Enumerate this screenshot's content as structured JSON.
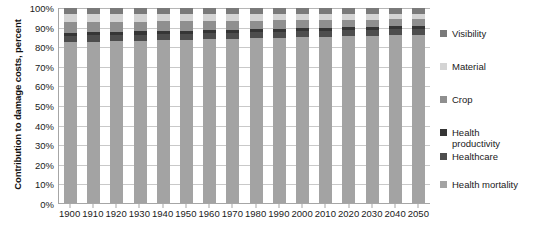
{
  "chart_data": {
    "type": "bar",
    "subtype": "100% stacked column",
    "title": "",
    "xlabel": "",
    "ylabel": "Contribution to damage costs, percent",
    "ylim": [
      0,
      100
    ],
    "yticks": [
      "0%",
      "10%",
      "20%",
      "30%",
      "40%",
      "50%",
      "60%",
      "70%",
      "80%",
      "90%",
      "100%"
    ],
    "ytick_values": [
      0,
      10,
      20,
      30,
      40,
      50,
      60,
      70,
      80,
      90,
      100
    ],
    "grid": true,
    "grid_axis": "y",
    "legend_position": "right",
    "categories": [
      "1900",
      "1910",
      "1920",
      "1930",
      "1940",
      "1950",
      "1960",
      "1970",
      "1980",
      "1990",
      "2000",
      "2010",
      "2020",
      "2030",
      "2040",
      "2050"
    ],
    "stack_order_bottom_to_top": [
      "Health mortality",
      "Healthcare",
      "Health productivity",
      "Crop",
      "Material",
      "Visibility"
    ],
    "series": [
      {
        "name": "Health mortality",
        "color": "#a3a3a3",
        "values": [
          82.5,
          82.8,
          83.0,
          83.2,
          83.4,
          83.6,
          83.9,
          84.1,
          84.4,
          84.6,
          84.9,
          85.1,
          85.4,
          85.6,
          85.9,
          86.1
        ]
      },
      {
        "name": "Healthcare",
        "color": "#4d4d4d",
        "values": [
          3.2,
          3.2,
          3.2,
          3.2,
          3.2,
          3.2,
          3.2,
          3.2,
          3.2,
          3.2,
          3.2,
          3.2,
          3.1,
          3.1,
          3.1,
          3.1
        ]
      },
      {
        "name": "Health productivity",
        "color": "#353535",
        "values": [
          1.6,
          1.6,
          1.6,
          1.6,
          1.6,
          1.6,
          1.6,
          1.6,
          1.6,
          1.6,
          1.6,
          1.6,
          1.6,
          1.6,
          1.6,
          1.6
        ]
      },
      {
        "name": "Crop",
        "color": "#8f8f8f",
        "values": [
          5.4,
          5.2,
          5.1,
          5.0,
          4.9,
          4.8,
          4.6,
          4.5,
          4.3,
          4.2,
          4.0,
          3.9,
          3.8,
          3.7,
          3.5,
          3.4
        ]
      },
      {
        "name": "Material",
        "color": "#d4d4d4",
        "values": [
          4.1,
          4.0,
          3.9,
          3.8,
          3.7,
          3.6,
          3.5,
          3.4,
          3.3,
          3.2,
          3.1,
          3.0,
          2.9,
          2.8,
          2.7,
          2.6
        ]
      },
      {
        "name": "Visibility",
        "color": "#7a7a7a",
        "values": [
          3.2,
          3.2,
          3.2,
          3.2,
          3.2,
          3.2,
          3.2,
          3.2,
          3.2,
          3.2,
          3.2,
          3.2,
          3.2,
          3.2,
          3.2,
          3.2
        ]
      }
    ]
  },
  "legend": {
    "items": [
      {
        "label": "Visibility",
        "color": "#7a7a7a"
      },
      {
        "label": "Material",
        "color": "#d4d4d4"
      },
      {
        "label": "Crop",
        "color": "#8f8f8f"
      },
      {
        "label": "Health\nproductivity",
        "color": "#353535"
      },
      {
        "label": "Healthcare",
        "color": "#4d4d4d"
      },
      {
        "label": "Health mortality",
        "color": "#a3a3a3"
      }
    ]
  },
  "axes": {
    "y_title": "Contribution to damage costs, percent"
  },
  "colors": {
    "gridline": "#c9c9c9",
    "axis": "#a6a6a6",
    "text": "#1a1a1a",
    "background": "#ffffff"
  }
}
